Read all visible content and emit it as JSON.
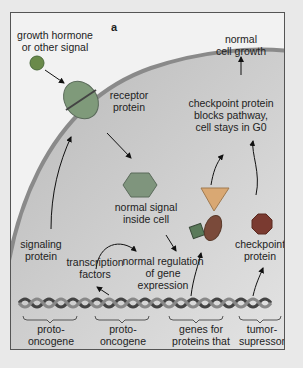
{
  "panel_label": "a",
  "labels": {
    "growth_signal": "growth hormone\nor other signal",
    "receptor": "receptor\nprotein",
    "normal_growth": "normal\ncell growth",
    "checkpoint_blocks": "checkpoint protein\nblocks pathway,\ncell stays in G0",
    "normal_signal": "normal signal\ninside cell",
    "signaling_protein": "signaling\nprotein",
    "transcription_factors": "transcription\nfactors",
    "normal_regulation": "normal regulation\nof gene\nexpression",
    "checkpoint_protein": "checkpoint\nprotein",
    "proto1": "proto-\noncogene",
    "proto2": "proto-\noncogene",
    "genes_division": "genes for\nproteins that\ntrigger cell division",
    "tumor_suppressor": "tumor-\nsupressor\ngene"
  },
  "colors": {
    "cell_fill": "#bdbdbd",
    "membrane": "#8a8a8a",
    "signal_ball": "#6a8a4a",
    "receptor": "#7f9a7a",
    "hexagon": "#7f957d",
    "triangle": "#d9a873",
    "ellipse": "#7a4a3a",
    "octagon": "#7a3a30"
  }
}
